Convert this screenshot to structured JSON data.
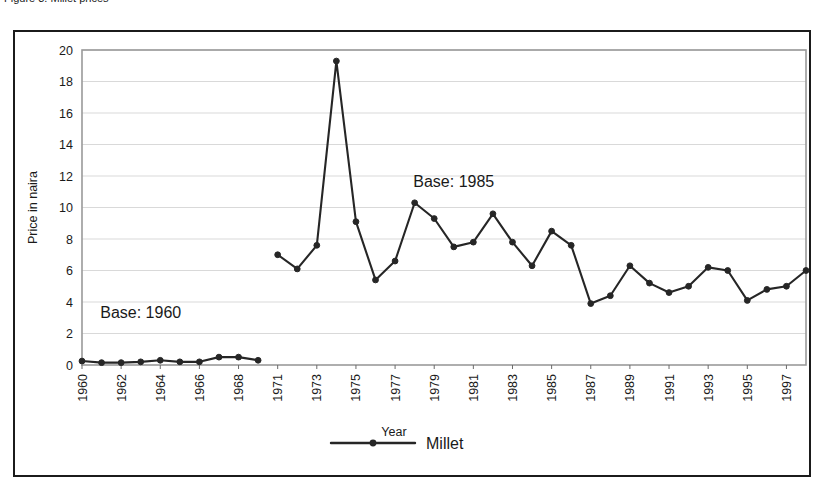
{
  "caption_sliver": "Figure 3. Millet prices",
  "chart_data": {
    "type": "line",
    "title": "",
    "xlabel": "Year",
    "ylabel": "Price in naira",
    "ylim": [
      0,
      20
    ],
    "ytick_step": 2,
    "yticks": [
      "0",
      "2",
      "4",
      "6",
      "8",
      "10",
      "12",
      "14",
      "16",
      "18",
      "20"
    ],
    "xticks": [
      "1960",
      "1962",
      "1964",
      "1966",
      "1968",
      "1971",
      "1973",
      "1975",
      "1977",
      "1979",
      "1981",
      "1983",
      "1985",
      "1987",
      "1989",
      "1991",
      "1993",
      "1995",
      "1997"
    ],
    "x_all": [
      "1960",
      "1961",
      "1962",
      "1963",
      "1964",
      "1965",
      "1966",
      "1967",
      "1968",
      "1969",
      "1971",
      "1972",
      "1973",
      "1974",
      "1975",
      "1976",
      "1977",
      "1978",
      "1979",
      "1980",
      "1981",
      "1982",
      "1983",
      "1984",
      "1985",
      "1986",
      "1987",
      "1988",
      "1989",
      "1990",
      "1991",
      "1992",
      "1993",
      "1994",
      "1995",
      "1996",
      "1997",
      "1998"
    ],
    "grid": true,
    "grid_axis": "y",
    "legend_position": "bottom",
    "line_color": "#262626",
    "marker_color": "#262626",
    "series": [
      {
        "name": "Millet",
        "segments": [
          {
            "label": "Base: 1960",
            "x": [
              "1960",
              "1961",
              "1962",
              "1963",
              "1964",
              "1965",
              "1966",
              "1967",
              "1968",
              "1969"
            ],
            "values": [
              0.25,
              0.15,
              0.15,
              0.2,
              0.3,
              0.2,
              0.2,
              0.5,
              0.5,
              0.3
            ]
          },
          {
            "label": "Base: 1985",
            "x": [
              "1971",
              "1972",
              "1973",
              "1974",
              "1975",
              "1976",
              "1977",
              "1978",
              "1979",
              "1980",
              "1981",
              "1982",
              "1983",
              "1984",
              "1985",
              "1986",
              "1987",
              "1988",
              "1989",
              "1990",
              "1991",
              "1992",
              "1993",
              "1994",
              "1995",
              "1996",
              "1997",
              "1998"
            ],
            "values": [
              7.0,
              6.1,
              7.6,
              19.3,
              9.1,
              5.4,
              6.6,
              10.3,
              9.3,
              7.5,
              7.8,
              9.6,
              7.8,
              6.3,
              8.5,
              7.6,
              3.9,
              4.4,
              6.3,
              5.2,
              4.6,
              5.0,
              6.2,
              6.0,
              4.1,
              4.8,
              5.0,
              6.0
            ]
          }
        ]
      }
    ],
    "annotations": [
      {
        "text": "Base: 1960",
        "x": "1963",
        "y": 3.0
      },
      {
        "text": "Base: 1985",
        "x": "1980",
        "y": 11.3
      }
    ],
    "legend": [
      {
        "label": "Millet",
        "marker": "circle",
        "color": "#262626"
      }
    ]
  }
}
